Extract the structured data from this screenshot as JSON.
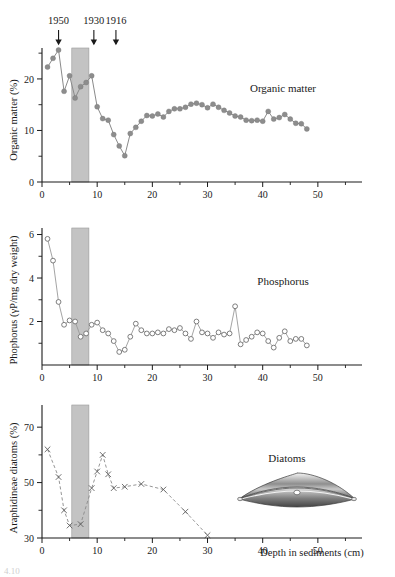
{
  "figure": {
    "caption_fragment": "4.10"
  },
  "markers": {
    "years": [
      {
        "label": "1950",
        "depth_cm": 3.0
      },
      {
        "label": "1930",
        "depth_cm": 9.4
      },
      {
        "label": "1916",
        "depth_cm": 13.4
      }
    ],
    "shaded_band": {
      "from_cm": 5.4,
      "to_cm": 8.5,
      "color": "#c3c3c3"
    }
  },
  "xaxis": {
    "label": "Depth in sediments (cm)",
    "ticks": [
      0,
      10,
      20,
      30,
      40,
      50
    ],
    "minor_ticks": [
      5,
      15,
      25,
      35,
      45,
      55
    ],
    "range": [
      0,
      58
    ]
  },
  "chart_data": [
    {
      "type": "line",
      "title": "Organic matter",
      "series_label": "Organic matter",
      "marker": "filled-circle",
      "color": "#8d8d8d",
      "xlabel": "Depth in sediments (cm)",
      "ylabel": "Organic matter (%)",
      "xlim": [
        0,
        58
      ],
      "ylim": [
        0,
        26
      ],
      "yticks": [
        0,
        10,
        20
      ],
      "yminor": [
        5,
        15,
        25
      ],
      "grid": false,
      "x": [
        1,
        2,
        3,
        4,
        5,
        6,
        7,
        8,
        9,
        10,
        11,
        12,
        13,
        14,
        15,
        16,
        17,
        18,
        19,
        20,
        21,
        22,
        23,
        24,
        25,
        26,
        27,
        28,
        29,
        30,
        31,
        32,
        33,
        34,
        35,
        36,
        37,
        38,
        39,
        40,
        41,
        42,
        43,
        44,
        45,
        46,
        47,
        48
      ],
      "values": [
        22.3,
        24.0,
        25.6,
        17.6,
        20.6,
        16.3,
        18.5,
        19.3,
        20.6,
        14.6,
        12.3,
        12.0,
        9.2,
        7.0,
        5.1,
        9.4,
        10.6,
        11.8,
        12.9,
        12.8,
        13.2,
        12.6,
        13.7,
        14.2,
        14.2,
        14.5,
        15.1,
        15.3,
        15.0,
        14.4,
        15.1,
        14.5,
        13.9,
        13.4,
        12.8,
        12.6,
        12.0,
        11.9,
        12.0,
        11.8,
        13.7,
        12.2,
        12.5,
        13.1,
        12.2,
        11.4,
        11.3,
        10.3
      ]
    },
    {
      "type": "line",
      "title": "Phosphorus",
      "series_label": "Phosphorus",
      "marker": "open-circle",
      "color": "#6f6f6f",
      "xlabel": "Depth in sediments (cm)",
      "ylabel": "Phophorus (γP/mg dry weight)",
      "xlim": [
        0,
        58
      ],
      "ylim": [
        0,
        6.3
      ],
      "yticks": [
        2,
        4,
        6
      ],
      "yminor": [
        1,
        3,
        5
      ],
      "grid": false,
      "x": [
        1,
        2,
        3,
        4,
        5,
        6,
        7,
        8,
        9,
        10,
        11,
        12,
        13,
        14,
        15,
        16,
        17,
        18,
        19,
        20,
        21,
        22,
        23,
        24,
        25,
        26,
        27,
        28,
        29,
        30,
        31,
        32,
        33,
        34,
        35,
        36,
        37,
        38,
        39,
        40,
        41,
        42,
        43,
        44,
        45,
        46,
        47,
        48
      ],
      "values": [
        5.8,
        4.8,
        2.9,
        1.85,
        2.05,
        2.0,
        1.3,
        1.45,
        1.85,
        1.95,
        1.6,
        1.45,
        1.1,
        0.6,
        0.7,
        1.3,
        1.9,
        1.6,
        1.45,
        1.45,
        1.5,
        1.45,
        1.65,
        1.6,
        1.7,
        1.45,
        1.2,
        2.0,
        1.5,
        1.45,
        1.25,
        1.5,
        1.4,
        1.45,
        2.7,
        0.95,
        1.15,
        1.3,
        1.5,
        1.45,
        1.1,
        0.8,
        1.25,
        1.55,
        1.1,
        1.2,
        1.2,
        0.9
      ]
    },
    {
      "type": "line",
      "title": "Diatoms",
      "series_label": "Diatoms",
      "marker": "x",
      "color": "#5f5f5f",
      "linestyle": "dashed",
      "xlabel": "Depth in sediments (cm)",
      "ylabel": "Araphidineae diatoms (%)",
      "xlim": [
        0,
        58
      ],
      "ylim": [
        30,
        78
      ],
      "yticks": [
        30,
        50,
        70
      ],
      "yminor": [
        40,
        60
      ],
      "grid": false,
      "x": [
        1,
        3,
        4,
        5,
        7,
        9,
        10,
        11,
        12,
        13,
        15,
        18,
        22,
        26,
        30
      ],
      "values": [
        62,
        52,
        40,
        34.5,
        35,
        48,
        54,
        60,
        53,
        48,
        48.5,
        49.5,
        47.5,
        39.5,
        31
      ]
    }
  ],
  "illustration": {
    "name": "diatom-frustule",
    "shape": "lens"
  }
}
